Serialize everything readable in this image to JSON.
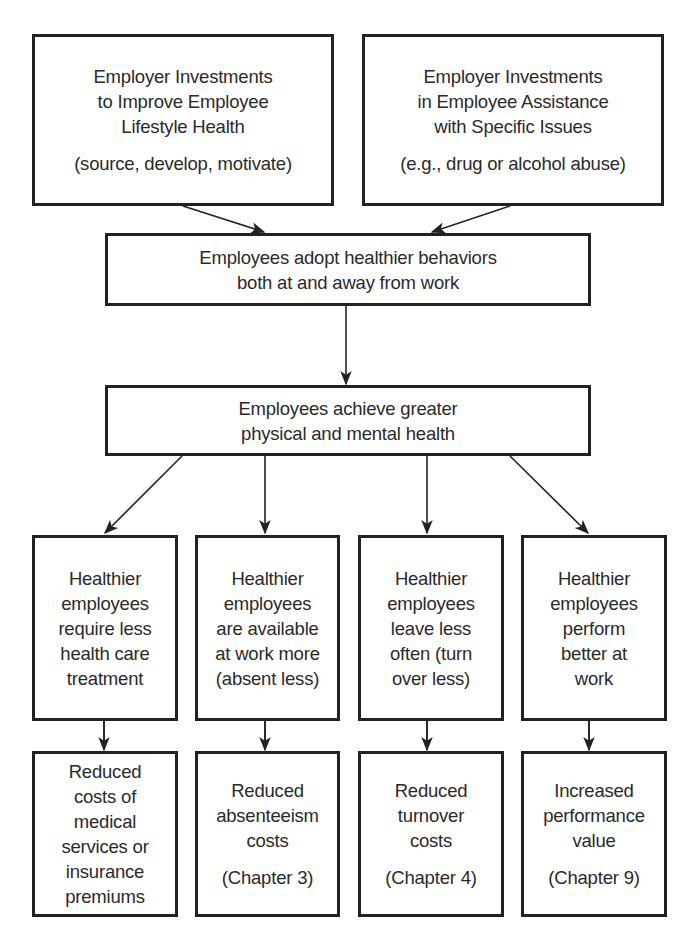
{
  "diagram": {
    "top_left": {
      "lines": [
        "Employer Investments",
        "to Improve Employee",
        "Lifestyle Health"
      ],
      "note": "(source, develop, motivate)"
    },
    "top_right": {
      "lines": [
        "Employer Investments",
        "in Employee Assistance",
        "with Specific Issues"
      ],
      "note": "(e.g., drug or alcohol abuse)"
    },
    "adopt": {
      "lines": [
        "Employees adopt healthier behaviors",
        "both at and away from work"
      ]
    },
    "achieve": {
      "lines": [
        "Employees achieve greater",
        "physical and mental health"
      ]
    },
    "outcomes": [
      {
        "lines": [
          "Healthier",
          "employees",
          "require less",
          "health care",
          "treatment"
        ]
      },
      {
        "lines": [
          "Healthier",
          "employees",
          "are available",
          "at work more",
          "(absent less)"
        ]
      },
      {
        "lines": [
          "Healthier",
          "employees",
          "leave less",
          "often (turn",
          "over less)"
        ]
      },
      {
        "lines": [
          "Healthier",
          "employees",
          "perform",
          "better at",
          "work"
        ]
      }
    ],
    "results": [
      {
        "lines": [
          "Reduced",
          "costs of",
          "medical",
          "services or",
          "insurance",
          "premiums"
        ],
        "note": ""
      },
      {
        "lines": [
          "Reduced",
          "absenteeism",
          "costs"
        ],
        "note": "(Chapter 3)"
      },
      {
        "lines": [
          "Reduced",
          "turnover",
          "costs"
        ],
        "note": "(Chapter 4)"
      },
      {
        "lines": [
          "Increased",
          "performance",
          "value"
        ],
        "note": "(Chapter 9)"
      }
    ],
    "colors": {
      "stroke": "#222222",
      "text": "#2a2a2a",
      "background": "#ffffff"
    }
  }
}
